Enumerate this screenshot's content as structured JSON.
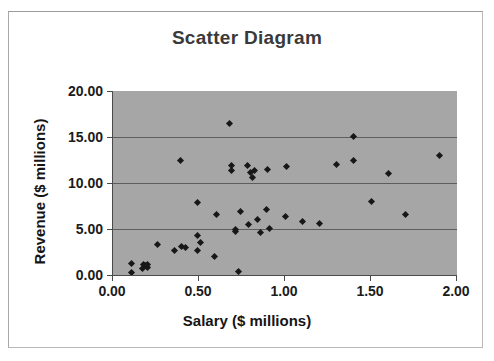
{
  "chart_data": {
    "type": "scatter",
    "title": "Scatter Diagram",
    "xlabel": "Salary ($ millions)",
    "ylabel": "Revenue ($ millions)",
    "xlim": [
      0.0,
      2.0
    ],
    "ylim": [
      0.0,
      20.0
    ],
    "xticks": [
      "0.00",
      "0.50",
      "1.00",
      "1.50",
      "2.00"
    ],
    "xtick_values": [
      0.0,
      0.5,
      1.0,
      1.5,
      2.0
    ],
    "yticks": [
      "0.00",
      "5.00",
      "10.00",
      "15.00",
      "20.00"
    ],
    "ytick_values": [
      0.0,
      5.0,
      10.0,
      15.0,
      20.0
    ],
    "grid": "horizontal",
    "legend": "none",
    "plot_background_color": "#a6a6a6",
    "marker_color": "#171717",
    "marker_shape": "diamond",
    "series": [
      {
        "name": "Salary vs Revenue",
        "points": [
          [
            0.11,
            1.3
          ],
          [
            0.11,
            0.3
          ],
          [
            0.17,
            0.75
          ],
          [
            0.18,
            1.1
          ],
          [
            0.19,
            1.05
          ],
          [
            0.2,
            0.8
          ],
          [
            0.2,
            1.15
          ],
          [
            0.26,
            3.35
          ],
          [
            0.36,
            2.7
          ],
          [
            0.39,
            12.45
          ],
          [
            0.4,
            3.15
          ],
          [
            0.42,
            2.95
          ],
          [
            0.49,
            7.9
          ],
          [
            0.49,
            4.25
          ],
          [
            0.49,
            2.7
          ],
          [
            0.51,
            3.55
          ],
          [
            0.59,
            2.05
          ],
          [
            0.6,
            6.55
          ],
          [
            0.68,
            16.5
          ],
          [
            0.69,
            11.95
          ],
          [
            0.69,
            11.4
          ],
          [
            0.71,
            4.9
          ],
          [
            0.71,
            4.7
          ],
          [
            0.73,
            0.35
          ],
          [
            0.74,
            6.85
          ],
          [
            0.78,
            11.9
          ],
          [
            0.79,
            5.45
          ],
          [
            0.8,
            11.15
          ],
          [
            0.81,
            10.6
          ],
          [
            0.82,
            11.4
          ],
          [
            0.84,
            6.05
          ],
          [
            0.86,
            4.6
          ],
          [
            0.89,
            7.15
          ],
          [
            0.9,
            11.45
          ],
          [
            0.91,
            5.05
          ],
          [
            1.0,
            6.4
          ],
          [
            1.01,
            11.75
          ],
          [
            1.1,
            5.85
          ],
          [
            1.2,
            5.6
          ],
          [
            1.3,
            12.05
          ],
          [
            1.4,
            15.05
          ],
          [
            1.4,
            12.4
          ],
          [
            1.5,
            7.95
          ],
          [
            1.6,
            11.05
          ],
          [
            1.7,
            6.55
          ],
          [
            1.9,
            12.95
          ]
        ]
      }
    ]
  }
}
